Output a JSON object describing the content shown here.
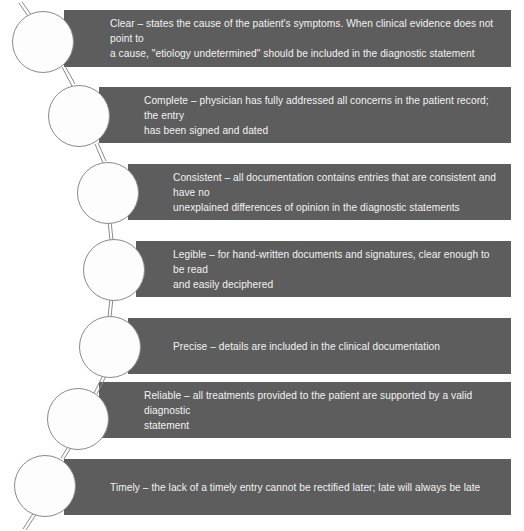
{
  "diagram": {
    "band_color": "#5d5d5d",
    "band_text_color": "#f2f2f2",
    "circle_fill": "#fdfdfd",
    "circle_stroke": "#8a8a8a",
    "background": "#ffffff",
    "steps": [
      {
        "key": "clear",
        "label": "Clear",
        "text": "Clear – states the cause of the patient's symptoms. When clinical evidence does not point to\na cause, \"etiology undetermined\" should be included in the diagnostic statement"
      },
      {
        "key": "complete",
        "label": "Complete",
        "text": "Complete – physician has fully addressed all concerns in the patient record; the entry\nhas been signed and dated"
      },
      {
        "key": "consistent",
        "label": "Consistent",
        "text": "Consistent – all documentation contains entries that are consistent and have no\nunexplained differences of opinion in the diagnostic statements"
      },
      {
        "key": "legible",
        "label": "Legible",
        "text": "Legible – for hand-written documents and signatures, clear enough to be read\nand easily deciphered"
      },
      {
        "key": "precise",
        "label": "Precise",
        "text": "Precise – details are included in the clinical documentation"
      },
      {
        "key": "reliable",
        "label": "Reliable",
        "text": "Reliable – all treatments provided to the patient are supported by a valid diagnostic\nstatement"
      },
      {
        "key": "timely",
        "label": "Timely",
        "text": "Timely – the lack of a timely entry cannot be rectified later; late will always be late"
      }
    ]
  }
}
